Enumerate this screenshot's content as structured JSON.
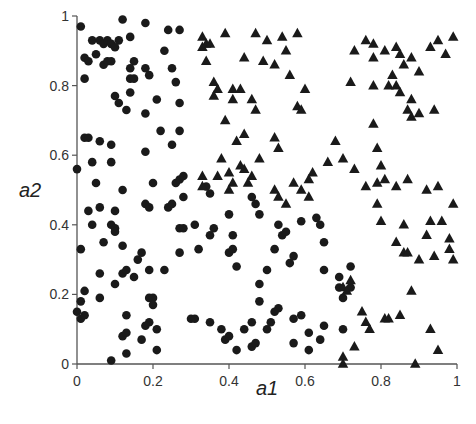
{
  "chart_data": {
    "type": "scatter",
    "title": "",
    "xlabel": "a1",
    "ylabel": "a2",
    "xlim": [
      0,
      1
    ],
    "ylim": [
      0,
      1
    ],
    "xticks": [
      "0",
      "0.2",
      "0.4",
      "0.6",
      "0.8",
      "1"
    ],
    "yticks": [
      "0",
      "0.2",
      "0.4",
      "0.6",
      "0.8",
      "1"
    ],
    "grid": false,
    "legend": null,
    "colors": {
      "points": "#1a1a1a",
      "axis": "#555555"
    },
    "series": [
      {
        "name": "class-circle",
        "marker": "circle",
        "points": [
          [
            0.01,
            0.97
          ],
          [
            0.04,
            0.93
          ],
          [
            0.05,
            0.89
          ],
          [
            0.06,
            0.93
          ],
          [
            0.07,
            0.92
          ],
          [
            0.08,
            0.93
          ],
          [
            0.09,
            0.92
          ],
          [
            0.1,
            0.91
          ],
          [
            0.11,
            0.93
          ],
          [
            0.02,
            0.88
          ],
          [
            0.03,
            0.87
          ],
          [
            0.07,
            0.86
          ],
          [
            0.08,
            0.87
          ],
          [
            0.09,
            0.87
          ],
          [
            0.02,
            0.82
          ],
          [
            0.12,
            0.99
          ],
          [
            0.14,
            0.94
          ],
          [
            0.18,
            0.98
          ],
          [
            0.24,
            0.96
          ],
          [
            0.27,
            0.96
          ],
          [
            0.23,
            0.9
          ],
          [
            0.25,
            0.85
          ],
          [
            0.15,
            0.87
          ],
          [
            0.14,
            0.85
          ],
          [
            0.14,
            0.82
          ],
          [
            0.15,
            0.82
          ],
          [
            0.14,
            0.78
          ],
          [
            0.18,
            0.85
          ],
          [
            0.19,
            0.83
          ],
          [
            0.26,
            0.81
          ],
          [
            0.21,
            0.76
          ],
          [
            0.1,
            0.77
          ],
          [
            0.11,
            0.75
          ],
          [
            0.13,
            0.73
          ],
          [
            0.18,
            0.72
          ],
          [
            0.22,
            0.67
          ],
          [
            0.27,
            0.67
          ],
          [
            0.27,
            0.75
          ],
          [
            0.02,
            0.65
          ],
          [
            0.03,
            0.65
          ],
          [
            0.06,
            0.64
          ],
          [
            0.09,
            0.63
          ],
          [
            0.04,
            0.58
          ],
          [
            0.09,
            0.58
          ],
          [
            0.0,
            0.56
          ],
          [
            0.05,
            0.52
          ],
          [
            0.12,
            0.5
          ],
          [
            0.2,
            0.52
          ],
          [
            0.26,
            0.52
          ],
          [
            0.27,
            0.53
          ],
          [
            0.28,
            0.54
          ],
          [
            0.34,
            0.51
          ],
          [
            0.35,
            0.49
          ],
          [
            0.18,
            0.61
          ],
          [
            0.25,
            0.63
          ],
          [
            0.03,
            0.44
          ],
          [
            0.06,
            0.45
          ],
          [
            0.1,
            0.44
          ],
          [
            0.04,
            0.4
          ],
          [
            0.09,
            0.4
          ],
          [
            0.1,
            0.39
          ],
          [
            0.07,
            0.35
          ],
          [
            0.1,
            0.38
          ],
          [
            0.18,
            0.46
          ],
          [
            0.19,
            0.45
          ],
          [
            0.24,
            0.45
          ],
          [
            0.25,
            0.46
          ],
          [
            0.28,
            0.48
          ],
          [
            0.27,
            0.39
          ],
          [
            0.28,
            0.39
          ],
          [
            0.31,
            0.4
          ],
          [
            0.32,
            0.33
          ],
          [
            0.35,
            0.37
          ],
          [
            0.36,
            0.39
          ],
          [
            0.4,
            0.43
          ],
          [
            0.41,
            0.37
          ],
          [
            0.4,
            0.32
          ],
          [
            0.41,
            0.33
          ],
          [
            0.42,
            0.28
          ],
          [
            0.12,
            0.34
          ],
          [
            0.16,
            0.3
          ],
          [
            0.17,
            0.32
          ],
          [
            0.19,
            0.27
          ],
          [
            0.23,
            0.27
          ],
          [
            0.27,
            0.32
          ],
          [
            0.01,
            0.33
          ],
          [
            0.06,
            0.26
          ],
          [
            0.12,
            0.26
          ],
          [
            0.13,
            0.27
          ],
          [
            0.15,
            0.25
          ],
          [
            0.1,
            0.23
          ],
          [
            0.01,
            0.18
          ],
          [
            0.02,
            0.21
          ],
          [
            0.06,
            0.19
          ],
          [
            0.19,
            0.19
          ],
          [
            0.2,
            0.19
          ],
          [
            0.2,
            0.17
          ],
          [
            0.0,
            0.15
          ],
          [
            0.01,
            0.13
          ],
          [
            0.02,
            0.14
          ],
          [
            0.13,
            0.14
          ],
          [
            0.19,
            0.12
          ],
          [
            0.21,
            0.1
          ],
          [
            0.18,
            0.11
          ],
          [
            0.12,
            0.08
          ],
          [
            0.13,
            0.09
          ],
          [
            0.17,
            0.07
          ],
          [
            0.13,
            0.03
          ],
          [
            0.09,
            0.01
          ],
          [
            0.21,
            0.04
          ],
          [
            0.3,
            0.13
          ],
          [
            0.31,
            0.13
          ],
          [
            0.35,
            0.12
          ],
          [
            0.38,
            0.1
          ],
          [
            0.39,
            0.07
          ],
          [
            0.4,
            0.08
          ],
          [
            0.44,
            0.1
          ],
          [
            0.46,
            0.48
          ],
          [
            0.47,
            0.46
          ],
          [
            0.48,
            0.43
          ],
          [
            0.53,
            0.4
          ],
          [
            0.54,
            0.37
          ],
          [
            0.55,
            0.38
          ],
          [
            0.52,
            0.33
          ],
          [
            0.57,
            0.31
          ],
          [
            0.56,
            0.29
          ],
          [
            0.63,
            0.42
          ],
          [
            0.64,
            0.4
          ],
          [
            0.65,
            0.35
          ],
          [
            0.65,
            0.27
          ],
          [
            0.72,
            0.28
          ],
          [
            0.69,
            0.22
          ],
          [
            0.7,
            0.19
          ],
          [
            0.69,
            0.25
          ],
          [
            0.72,
            0.22
          ],
          [
            0.59,
            0.41
          ],
          [
            0.5,
            0.27
          ],
          [
            0.48,
            0.23
          ],
          [
            0.48,
            0.18
          ],
          [
            0.46,
            0.12
          ],
          [
            0.5,
            0.1
          ],
          [
            0.53,
            0.16
          ],
          [
            0.52,
            0.15
          ],
          [
            0.57,
            0.13
          ],
          [
            0.59,
            0.14
          ],
          [
            0.61,
            0.09
          ],
          [
            0.57,
            0.06
          ],
          [
            0.61,
            0.04
          ],
          [
            0.64,
            0.07
          ],
          [
            0.65,
            0.11
          ],
          [
            0.7,
            0.1
          ],
          [
            0.51,
            0.12
          ],
          [
            0.46,
            0.05
          ],
          [
            0.47,
            0.06
          ],
          [
            0.42,
            0.04
          ]
        ]
      },
      {
        "name": "class-triangle",
        "marker": "triangle",
        "points": [
          [
            0.33,
            0.94
          ],
          [
            0.33,
            0.91
          ],
          [
            0.34,
            0.92
          ],
          [
            0.35,
            0.92
          ],
          [
            0.34,
            0.87
          ],
          [
            0.39,
            0.95
          ],
          [
            0.36,
            0.81
          ],
          [
            0.37,
            0.79
          ],
          [
            0.36,
            0.77
          ],
          [
            0.41,
            0.79
          ],
          [
            0.43,
            0.79
          ],
          [
            0.41,
            0.76
          ],
          [
            0.39,
            0.7
          ],
          [
            0.42,
            0.64
          ],
          [
            0.44,
            0.88
          ],
          [
            0.49,
            0.87
          ],
          [
            0.47,
            0.95
          ],
          [
            0.5,
            0.93
          ],
          [
            0.52,
            0.86
          ],
          [
            0.55,
            0.9
          ],
          [
            0.54,
            0.94
          ],
          [
            0.56,
            0.83
          ],
          [
            0.58,
            0.95
          ],
          [
            0.6,
            0.79
          ],
          [
            0.58,
            0.74
          ],
          [
            0.59,
            0.73
          ],
          [
            0.47,
            0.73
          ],
          [
            0.44,
            0.66
          ],
          [
            0.46,
            0.76
          ],
          [
            0.52,
            0.65
          ],
          [
            0.53,
            0.62
          ],
          [
            0.48,
            0.59
          ],
          [
            0.44,
            0.56
          ],
          [
            0.38,
            0.59
          ],
          [
            0.33,
            0.54
          ],
          [
            0.37,
            0.54
          ],
          [
            0.4,
            0.55
          ],
          [
            0.41,
            0.52
          ],
          [
            0.43,
            0.57
          ],
          [
            0.45,
            0.52
          ],
          [
            0.46,
            0.54
          ],
          [
            0.33,
            0.51
          ],
          [
            0.4,
            0.5
          ],
          [
            0.52,
            0.5
          ],
          [
            0.53,
            0.48
          ],
          [
            0.55,
            0.46
          ],
          [
            0.57,
            0.52
          ],
          [
            0.61,
            0.53
          ],
          [
            0.62,
            0.55
          ],
          [
            0.66,
            0.58
          ],
          [
            0.59,
            0.5
          ],
          [
            0.61,
            0.48
          ],
          [
            0.68,
            0.64
          ],
          [
            0.78,
            0.92
          ],
          [
            0.78,
            0.88
          ],
          [
            0.81,
            0.9
          ],
          [
            0.84,
            0.91
          ],
          [
            0.85,
            0.89
          ],
          [
            0.86,
            0.86
          ],
          [
            0.88,
            0.88
          ],
          [
            0.9,
            0.84
          ],
          [
            0.93,
            0.91
          ],
          [
            0.95,
            0.93
          ],
          [
            0.97,
            0.89
          ],
          [
            0.99,
            0.94
          ],
          [
            0.76,
            0.93
          ],
          [
            0.72,
            0.81
          ],
          [
            0.73,
            0.9
          ],
          [
            0.78,
            0.8
          ],
          [
            0.83,
            0.83
          ],
          [
            0.82,
            0.8
          ],
          [
            0.84,
            0.8
          ],
          [
            0.85,
            0.78
          ],
          [
            0.88,
            0.76
          ],
          [
            0.87,
            0.73
          ],
          [
            0.88,
            0.71
          ],
          [
            0.9,
            0.72
          ],
          [
            0.94,
            0.73
          ],
          [
            0.78,
            0.69
          ],
          [
            0.79,
            0.62
          ],
          [
            0.8,
            0.57
          ],
          [
            0.7,
            0.59
          ],
          [
            0.73,
            0.56
          ],
          [
            0.76,
            0.51
          ],
          [
            0.79,
            0.52
          ],
          [
            0.81,
            0.53
          ],
          [
            0.84,
            0.51
          ],
          [
            0.87,
            0.53
          ],
          [
            0.95,
            0.51
          ],
          [
            0.79,
            0.46
          ],
          [
            0.8,
            0.41
          ],
          [
            0.86,
            0.4
          ],
          [
            0.92,
            0.5
          ],
          [
            0.84,
            0.35
          ],
          [
            0.86,
            0.32
          ],
          [
            0.87,
            0.32
          ],
          [
            0.9,
            0.3
          ],
          [
            0.94,
            0.31
          ],
          [
            0.92,
            0.37
          ],
          [
            0.96,
            0.41
          ],
          [
            0.99,
            0.46
          ],
          [
            0.98,
            0.36
          ],
          [
            0.98,
            0.33
          ],
          [
            0.99,
            0.3
          ],
          [
            0.93,
            0.41
          ],
          [
            0.88,
            0.21
          ],
          [
            0.72,
            0.24
          ],
          [
            0.7,
            0.22
          ],
          [
            0.71,
            0.21
          ],
          [
            0.75,
            0.15
          ],
          [
            0.76,
            0.12
          ],
          [
            0.77,
            0.1
          ],
          [
            0.81,
            0.13
          ],
          [
            0.82,
            0.13
          ],
          [
            0.85,
            0.14
          ],
          [
            0.93,
            0.1
          ],
          [
            0.95,
            0.04
          ],
          [
            0.73,
            0.05
          ],
          [
            0.7,
            0.02
          ],
          [
            0.7,
            0.0
          ],
          [
            0.89,
            0.0
          ]
        ]
      }
    ]
  },
  "axes": {
    "x_label": "a1",
    "y_label": "a2",
    "x_ticks": [
      "0",
      "0.2",
      "0.4",
      "0.6",
      "0.8",
      "1"
    ],
    "y_ticks": [
      "0",
      "0.2",
      "0.4",
      "0.6",
      "0.8",
      "1"
    ]
  }
}
